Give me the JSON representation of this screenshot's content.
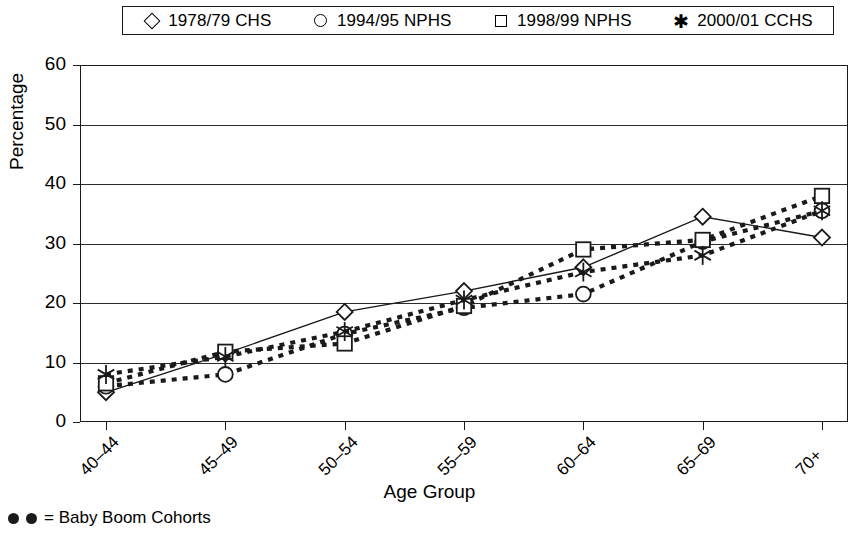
{
  "chart_data": {
    "type": "line",
    "title": "",
    "xlabel": "Age Group",
    "ylabel": "Percentage",
    "ylim": [
      0,
      60
    ],
    "yticks": [
      0,
      10,
      20,
      30,
      40,
      50,
      60
    ],
    "grid": true,
    "legend_position": "top",
    "categories": [
      "40–44",
      "45–49",
      "50–54",
      "55–59",
      "60–64",
      "65–69",
      "70+"
    ],
    "series": [
      {
        "name": "1978/79 CHS",
        "marker": "diamond",
        "linestyle": "solid",
        "values": [
          5.0,
          11.5,
          18.5,
          22.0,
          26.0,
          34.5,
          31.0
        ]
      },
      {
        "name": "1994/95 NPHS",
        "marker": "circle",
        "linestyle": "dotted",
        "values": [
          6.0,
          8.0,
          14.8,
          19.2,
          21.5,
          30.3,
          35.5
        ]
      },
      {
        "name": "1998/99 NPHS",
        "marker": "square",
        "linestyle": "dotted",
        "values": [
          6.5,
          11.8,
          13.2,
          19.5,
          29.0,
          30.6,
          38.0
        ]
      },
      {
        "name": "2000/01 CCHS",
        "marker": "star",
        "linestyle": "dotted",
        "values": [
          8.0,
          11.0,
          15.2,
          20.5,
          25.2,
          28.0,
          35.5
        ]
      }
    ],
    "annotations": [
      "●  ● = Baby Boom Cohorts"
    ]
  },
  "legend": {
    "entries": [
      {
        "label": "1978/79 CHS",
        "marker": "diamond-marker-icon"
      },
      {
        "label": "1994/95 NPHS",
        "marker": "circle-marker-icon"
      },
      {
        "label": "1998/99 NPHS",
        "marker": "square-marker-icon"
      },
      {
        "label": "2000/01 CCHS",
        "marker": "star-marker-icon"
      }
    ]
  },
  "axes": {
    "y_label": "Percentage",
    "x_label": "Age Group",
    "y_ticks": [
      "0",
      "10",
      "20",
      "30",
      "40",
      "50",
      "60"
    ],
    "x_ticks": [
      "40–44",
      "45–49",
      "50–54",
      "55–59",
      "60–64",
      "65–69",
      "70+"
    ]
  },
  "footnote": {
    "text": "= Baby Boom Cohorts"
  },
  "colors": {
    "ink": "#1a1a1a",
    "grid": "#2b2b2b",
    "background": "#ffffff"
  }
}
